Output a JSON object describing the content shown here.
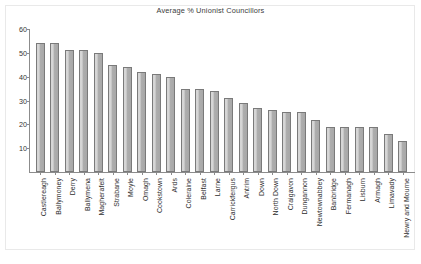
{
  "chart_data": {
    "type": "bar",
    "title": "Average % Unionist Councillors",
    "xlabel": "",
    "ylabel": "",
    "ylim": [
      0,
      60
    ],
    "yticks": [
      0,
      10,
      20,
      30,
      40,
      50,
      60
    ],
    "ytick_labels": [
      "",
      "10",
      "20",
      "30",
      "40",
      "50",
      "60"
    ],
    "grid": false,
    "legend": null,
    "bar_color": "#b5b5b5",
    "bar_edge_color": "#7a7a7a",
    "categories": [
      "Castlereagh",
      "Ballymoney",
      "Derry",
      "Ballymena",
      "Magherafelt",
      "Strabane",
      "Moyle",
      "Omagh",
      "Cookstown",
      "Ards",
      "Coleraine",
      "Belfast",
      "Larne",
      "Carrickfergus",
      "Antrim",
      "Down",
      "North Down",
      "Craigavon",
      "Dungannon",
      "Newtownabbey",
      "Banbridge",
      "Fermanagh",
      "Lisburn",
      "Armagh",
      "Limavady",
      "Newry and Mourne"
    ],
    "values": [
      54,
      54,
      51,
      51,
      50,
      45,
      44,
      42,
      41,
      40,
      35,
      35,
      34,
      31,
      29,
      27,
      26,
      25,
      25,
      22,
      19,
      19,
      19,
      19,
      16,
      13
    ]
  }
}
